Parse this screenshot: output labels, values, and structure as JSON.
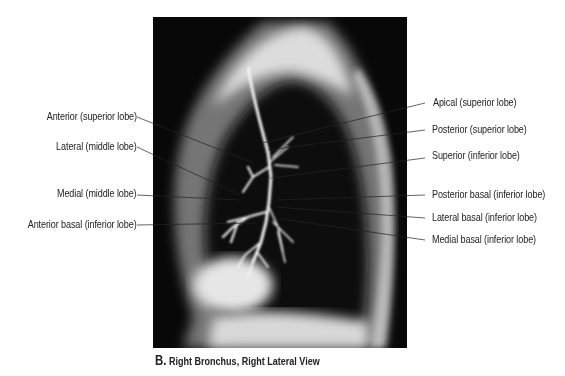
{
  "figure": {
    "caption_letter": "B.",
    "caption_text": "Right Bronchus, Right Lateral View",
    "image_alt": "Bronchogram radiograph of right lung, lateral view"
  },
  "labels_left": [
    {
      "text": "Anterior (superior lobe)"
    },
    {
      "text": "Lateral (middle lobe)"
    },
    {
      "text": "Medial (middle lobe)"
    },
    {
      "text": "Anterior basal (inferior lobe)"
    }
  ],
  "labels_right": [
    {
      "text": "Apical (superior lobe)"
    },
    {
      "text": "Posterior (superior lobe)"
    },
    {
      "text": "Superior (inferior lobe)"
    },
    {
      "text": "Posterior basal (inferior lobe)"
    },
    {
      "text": "Lateral basal (inferior lobe)"
    },
    {
      "text": "Medial basal (inferior lobe)"
    }
  ]
}
